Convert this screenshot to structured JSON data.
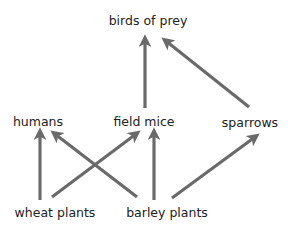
{
  "diagram": {
    "type": "food web",
    "arrow_color": "#6a6a6a",
    "text_color": "#222222",
    "nodes": {
      "birds_of_prey": {
        "label": "birds of prey",
        "x": 148,
        "y": 25
      },
      "humans": {
        "label": "humans",
        "x": 38,
        "y": 126
      },
      "field_mice": {
        "label": "field mice",
        "x": 144,
        "y": 126
      },
      "sparrows": {
        "label": "sparrows",
        "x": 250,
        "y": 127
      },
      "wheat_plants": {
        "label": "wheat plants",
        "x": 55,
        "y": 217
      },
      "barley_plants": {
        "label": "barley plants",
        "x": 167,
        "y": 217
      }
    },
    "edges": [
      {
        "from": "wheat plants",
        "to": "humans"
      },
      {
        "from": "wheat plants",
        "to": "field mice"
      },
      {
        "from": "barley plants",
        "to": "humans"
      },
      {
        "from": "barley plants",
        "to": "field mice"
      },
      {
        "from": "barley plants",
        "to": "sparrows"
      },
      {
        "from": "field mice",
        "to": "birds of prey"
      },
      {
        "from": "sparrows",
        "to": "birds of prey"
      }
    ]
  }
}
